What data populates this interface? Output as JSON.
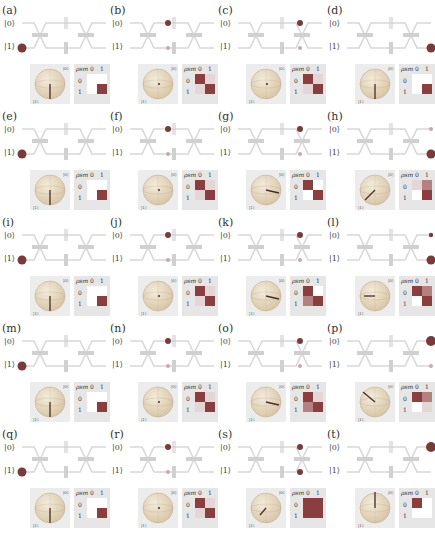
{
  "figure": {
    "ket0_label": "|0⟩",
    "ket1_label": "|1⟩",
    "rho_label": "ρsm",
    "rho_col_labels": [
      "0",
      "1"
    ],
    "rho_row_labels": [
      "0",
      "1"
    ],
    "colors": {
      "waveguide": "#d8d8d8",
      "component": "#d0d0d0",
      "photon": "#7a3a3a",
      "dark_cell": "#8a3e3e",
      "mid_cell": "#b58080",
      "light_cell": "#e4d6d6",
      "white_cell": "#ffffff",
      "rho_bg": "#e6e6e6",
      "sphere": "#d9c6a6"
    },
    "panels": [
      {
        "label": "(a)",
        "photon": [
          "in1"
        ],
        "bloch": "south",
        "rho": [
          "w",
          "w",
          "w",
          "d"
        ]
      },
      {
        "label": "(b)",
        "photon": [
          "mid0"
        ],
        "ghost": [
          "mid1"
        ],
        "bloch": "equator",
        "rho": [
          "d",
          "l",
          "l",
          "d"
        ]
      },
      {
        "label": "(c)",
        "photon": [
          "mid0b"
        ],
        "ghost": [
          "mid1b"
        ],
        "bloch": "equator",
        "rho": [
          "d",
          "l",
          "l",
          "d"
        ]
      },
      {
        "label": "(d)",
        "photon": [
          "out1"
        ],
        "bloch": "south",
        "rho": [
          "w",
          "w",
          "w",
          "d"
        ]
      },
      {
        "label": "(e)",
        "photon": [
          "in1"
        ],
        "bloch": "south",
        "rho": [
          "w",
          "w",
          "w",
          "d"
        ]
      },
      {
        "label": "(f)",
        "photon": [
          "mid0"
        ],
        "ghost": [
          "mid1"
        ],
        "bloch": "equator",
        "rho": [
          "d",
          "l",
          "l",
          "d"
        ]
      },
      {
        "label": "(g)",
        "photon": [
          "mid0b"
        ],
        "ghost": [
          "mid1b"
        ],
        "bloch": "equator-x",
        "rho": [
          "d",
          "w",
          "w",
          "d"
        ]
      },
      {
        "label": "(h)",
        "photon": [
          "out1"
        ],
        "ghost": [
          "out0"
        ],
        "bloch": "tilt",
        "rho": [
          "l",
          "m",
          "w",
          "d"
        ]
      },
      {
        "label": "(i)",
        "photon": [
          "in1"
        ],
        "bloch": "south",
        "rho": [
          "w",
          "w",
          "w",
          "d"
        ]
      },
      {
        "label": "(j)",
        "photon": [
          "mid0"
        ],
        "ghost": [
          "mid1"
        ],
        "bloch": "equator",
        "rho": [
          "d",
          "l",
          "l",
          "d"
        ]
      },
      {
        "label": "(k)",
        "photon": [
          "mid0b"
        ],
        "ghost": [
          "mid1b"
        ],
        "bloch": "equator-x",
        "rho": [
          "d",
          "w",
          "m",
          "d"
        ]
      },
      {
        "label": "(l)",
        "photon": [
          "out0",
          "out1"
        ],
        "bloch": "equator-neg",
        "rho": [
          "d",
          "m",
          "w",
          "d"
        ]
      },
      {
        "label": "(m)",
        "photon": [
          "in1"
        ],
        "bloch": "south",
        "rho": [
          "w",
          "w",
          "w",
          "d"
        ]
      },
      {
        "label": "(n)",
        "photon": [
          "mid0"
        ],
        "ghost": [
          "mid1"
        ],
        "bloch": "equator",
        "rho": [
          "d",
          "l",
          "l",
          "d"
        ]
      },
      {
        "label": "(o)",
        "photon": [
          "mid0b"
        ],
        "ghost": [
          "mid1b"
        ],
        "bloch": "equator-x",
        "rho": [
          "d",
          "l",
          "m",
          "d"
        ]
      },
      {
        "label": "(p)",
        "photon": [
          "out0big"
        ],
        "ghost": [
          "out1"
        ],
        "bloch": "tilt-up",
        "rho": [
          "d",
          "m",
          "w",
          "l"
        ]
      },
      {
        "label": "(q)",
        "photon": [
          "in1"
        ],
        "bloch": "south",
        "rho": [
          "w",
          "w",
          "w",
          "d"
        ]
      },
      {
        "label": "(r)",
        "photon": [
          "mid0"
        ],
        "ghost": [
          "mid1"
        ],
        "bloch": "equator",
        "rho": [
          "d",
          "l",
          "l",
          "d"
        ]
      },
      {
        "label": "(s)",
        "photon": [
          "mid0b",
          "mid1b"
        ],
        "bloch": "inner",
        "rho": [
          "big"
        ]
      },
      {
        "label": "(t)",
        "photon": [
          "out0big"
        ],
        "bloch": "north",
        "rho": [
          "d",
          "w",
          "w",
          "w"
        ]
      }
    ]
  }
}
